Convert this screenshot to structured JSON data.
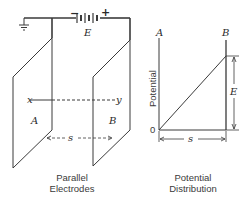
{
  "diagram": {
    "left_figure": {
      "caption_line1": "Parallel",
      "caption_line2": "Electrodes",
      "plate_a_label": "A",
      "plate_b_label": "B",
      "battery_label": "E",
      "battery_minus": "−",
      "battery_plus": "+",
      "axis_start_label": "x",
      "axis_end_label": "y",
      "separation_label": "s",
      "ground_symbol": "ground-icon"
    },
    "right_figure": {
      "caption_line1": "Potential",
      "caption_line2": "Distribution",
      "y_axis_label": "Potential",
      "left_axis_label": "A",
      "right_axis_label": "B",
      "origin_label": "0",
      "height_label": "E",
      "width_label": "s"
    },
    "colors": {
      "line": "#3a3a3a",
      "background": "#ffffff"
    }
  }
}
